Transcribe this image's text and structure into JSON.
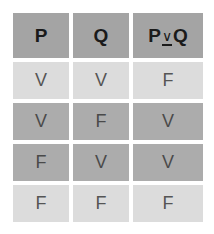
{
  "table": {
    "headers": [
      {
        "text": "P"
      },
      {
        "text": "Q"
      },
      {
        "left": "P",
        "operator": "∨",
        "right": "Q"
      }
    ],
    "rows": [
      {
        "style": "light",
        "cells": [
          "V",
          "V",
          "F"
        ]
      },
      {
        "style": "dark",
        "cells": [
          "V",
          "F",
          "V"
        ]
      },
      {
        "style": "dark",
        "cells": [
          "F",
          "V",
          "V"
        ]
      },
      {
        "style": "light",
        "cells": [
          "F",
          "F",
          "F"
        ]
      }
    ]
  },
  "colors": {
    "header_bg": "#a4a4a4",
    "dark_row_bg": "#acacac",
    "light_row_bg": "#dcdcdc"
  }
}
